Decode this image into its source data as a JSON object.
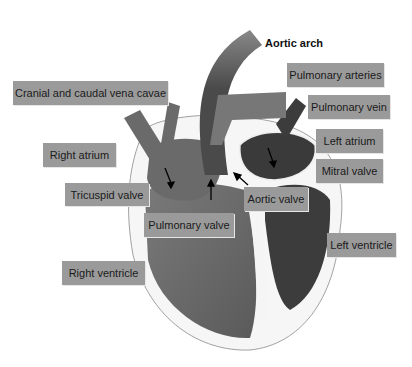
{
  "diagram": {
    "title_label": "Aortic arch",
    "labels": [
      {
        "id": "vena-cavae",
        "text": "Cranial and caudal vena cavae"
      },
      {
        "id": "right-atrium",
        "text": "Right atrium"
      },
      {
        "id": "tricuspid-valve",
        "text": "Tricuspid valve"
      },
      {
        "id": "pulmonary-valve",
        "text": "Pulmonary valve"
      },
      {
        "id": "right-ventricle",
        "text": "Right ventricle"
      },
      {
        "id": "pulmonary-arteries",
        "text": "Pulmonary arteries"
      },
      {
        "id": "pulmonary-vein",
        "text": "Pulmonary vein"
      },
      {
        "id": "left-atrium",
        "text": "Left atrium"
      },
      {
        "id": "mitral-valve",
        "text": "Mitral valve"
      },
      {
        "id": "aortic-valve",
        "text": "Aortic valve"
      },
      {
        "id": "left-ventricle",
        "text": "Left ventricle"
      }
    ],
    "colors": {
      "label_bg": "#9a9a9a",
      "right_side": "#6e6e6e",
      "left_side": "#3a3a3a",
      "aorta": "#555555",
      "pericardium": "#f4f4f4"
    }
  }
}
